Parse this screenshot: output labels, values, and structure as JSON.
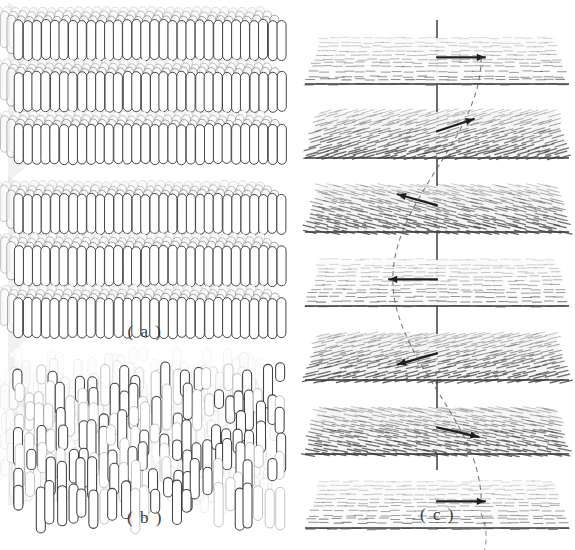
{
  "figure": {
    "width": 575,
    "height": 550,
    "background": "#ffffff",
    "ink": "#555555",
    "ink_dark": "#2b2b2b",
    "fill_light": "#fbfbfb",
    "shade": "#d8d8d8"
  },
  "panels": [
    {
      "id": "a",
      "label": "( a )",
      "label_x": 0,
      "label_y": 322,
      "label_width": 290,
      "caption_meaning": "smectic-A layered phase",
      "blocks": [
        {
          "name": "smectic-block-top",
          "x": 0,
          "y": 2,
          "width": 290,
          "height": 172,
          "layers": 3,
          "cols": 30,
          "rod_w": 9,
          "rod_h": 40,
          "layer_gap": 52,
          "depth_rows": 4,
          "depth_dx": -7,
          "depth_dy": -6
        },
        {
          "name": "smectic-block-bottom",
          "x": 0,
          "y": 176,
          "width": 290,
          "height": 148,
          "layers": 3,
          "cols": 30,
          "rod_w": 9,
          "rod_h": 40,
          "layer_gap": 52,
          "depth_rows": 4,
          "depth_dx": -7,
          "depth_dy": -6
        }
      ]
    },
    {
      "id": "b",
      "label": "( b )",
      "label_x": 0,
      "label_y": 508,
      "label_width": 290,
      "caption_meaning": "nematic phase, orientational order only",
      "blocks": [
        {
          "name": "nematic-block",
          "x": 0,
          "y": 360,
          "width": 290,
          "height": 140,
          "cols": 26,
          "rows": 7,
          "rod_w": 9,
          "rod_h_min": 18,
          "rod_h_max": 46,
          "jitter_y": 16,
          "depth_rows": 4,
          "depth_dx": -7,
          "depth_dy": -6
        }
      ]
    },
    {
      "id": "c",
      "label": "( c )",
      "label_x": 300,
      "label_y": 505,
      "label_width": 275,
      "caption_meaning": "cholesteric helix, director rotates plane to plane",
      "helix": {
        "axis_x": 137,
        "axis_top": 20,
        "axis_bottom": 470,
        "plane_count": 7,
        "plane_spacing": 74,
        "plane_first_y": 38,
        "plane_half_width": 118,
        "plane_near_half_width": 132,
        "plane_depth": 46,
        "arrow_length": 48,
        "planes": [
          {
            "index": 0,
            "director_deg": 0,
            "tilt_shade": "light",
            "arrow_dir": "right"
          },
          {
            "index": 1,
            "director_deg": 40,
            "tilt_shade": "dark",
            "arrow_dir": "down-right"
          },
          {
            "index": 2,
            "director_deg": 145,
            "tilt_shade": "dark",
            "arrow_dir": "down-left"
          },
          {
            "index": 3,
            "director_deg": 180,
            "tilt_shade": "light",
            "arrow_dir": "left"
          },
          {
            "index": 4,
            "director_deg": 215,
            "tilt_shade": "dark",
            "arrow_dir": "up-left"
          },
          {
            "index": 5,
            "director_deg": 330,
            "tilt_shade": "dark",
            "arrow_dir": "up-right"
          },
          {
            "index": 6,
            "director_deg": 360,
            "tilt_shade": "light",
            "arrow_dir": "right"
          }
        ]
      }
    }
  ]
}
